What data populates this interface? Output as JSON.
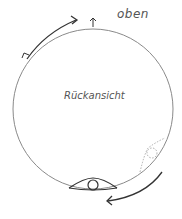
{
  "diagram": {
    "labels": {
      "top": "oben",
      "center": "Rückansicht"
    },
    "elements": [
      {
        "name": "main-circle",
        "type": "circle"
      },
      {
        "name": "eye-symbol",
        "position": "bottom"
      },
      {
        "name": "eye-symbol-dotted",
        "position": "lower-right"
      },
      {
        "name": "rotation-arrow-top-left",
        "direction": "clockwise"
      },
      {
        "name": "rotation-arrow-bottom-right",
        "direction": "clockwise"
      },
      {
        "name": "up-arrow",
        "position": "top"
      }
    ],
    "colors": {
      "line": "#888888",
      "arrow": "#333333",
      "text": "#555555"
    }
  }
}
